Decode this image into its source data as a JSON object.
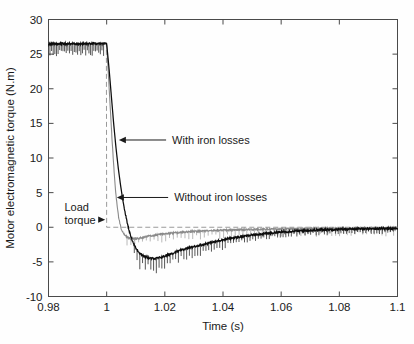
{
  "chart_data": {
    "type": "line",
    "title": "",
    "xlabel": "Time (s)",
    "ylabel": "Motor electromagnetic torque (N.m)",
    "xlim": [
      0.98,
      1.1
    ],
    "ylim": [
      -10,
      30
    ],
    "xticks": [
      0.98,
      1,
      1.02,
      1.04,
      1.06,
      1.08,
      1.1
    ],
    "xticklabels": [
      "0.98",
      "1",
      "1.02",
      "1.04",
      "1.06",
      "1.08",
      "1.1"
    ],
    "yticks": [
      -10,
      -5,
      0,
      5,
      10,
      15,
      20,
      25,
      30
    ],
    "yticklabels": [
      "-10",
      "-5",
      "0",
      "5",
      "10",
      "15",
      "20",
      "25",
      "30"
    ],
    "grid": false,
    "legend_position": "none",
    "box": true,
    "tick_direction": "in",
    "series": [
      {
        "name": "With iron losses",
        "color": "#0d0d0d",
        "style": "solid-noisy",
        "x": [
          0.98,
          0.9825,
          0.985,
          0.9875,
          0.99,
          0.9925,
          0.995,
          0.9975,
          1.0,
          1.0008,
          1.0016,
          1.0024,
          1.0032,
          1.004,
          1.0048,
          1.0056,
          1.0064,
          1.0072,
          1.008,
          1.009,
          1.01,
          1.0115,
          1.013,
          1.015,
          1.017,
          1.019,
          1.021,
          1.023,
          1.025,
          1.028,
          1.031,
          1.034,
          1.037,
          1.04,
          1.044,
          1.048,
          1.052,
          1.056,
          1.06,
          1.065,
          1.07,
          1.075,
          1.08,
          1.085,
          1.09,
          1.095,
          1.1
        ],
        "y": [
          26.5,
          26.5,
          26.5,
          26.5,
          26.5,
          26.5,
          26.5,
          26.5,
          26.5,
          23.0,
          19.0,
          15.0,
          11.5,
          8.5,
          6.0,
          3.8,
          2.0,
          0.4,
          -0.9,
          -2.1,
          -3.0,
          -3.8,
          -4.2,
          -4.5,
          -4.5,
          -4.3,
          -4.0,
          -3.7,
          -3.4,
          -3.0,
          -2.7,
          -2.4,
          -2.1,
          -1.8,
          -1.5,
          -1.25,
          -1.0,
          -0.85,
          -0.7,
          -0.55,
          -0.45,
          -0.35,
          -0.3,
          -0.25,
          -0.2,
          -0.18,
          -0.15
        ]
      },
      {
        "name": "Without iron losses",
        "color": "#8a8a8a",
        "style": "solid-noisy",
        "x": [
          0.98,
          0.985,
          0.99,
          0.995,
          1.0,
          1.0006,
          1.0012,
          1.0018,
          1.0024,
          1.003,
          1.0036,
          1.0042,
          1.005,
          1.006,
          1.007,
          1.008,
          1.0095,
          1.011,
          1.013,
          1.015,
          1.018,
          1.021,
          1.025,
          1.03,
          1.035,
          1.04,
          1.046,
          1.052,
          1.058,
          1.065,
          1.072,
          1.08,
          1.088,
          1.095,
          1.1
        ],
        "y": [
          26.5,
          26.5,
          26.5,
          26.5,
          26.5,
          22.0,
          17.5,
          13.0,
          9.0,
          5.6,
          3.0,
          1.2,
          -0.2,
          -1.0,
          -1.4,
          -1.6,
          -1.65,
          -1.6,
          -1.4,
          -1.25,
          -1.05,
          -0.9,
          -0.75,
          -0.6,
          -0.5,
          -0.42,
          -0.35,
          -0.3,
          -0.26,
          -0.22,
          -0.2,
          -0.18,
          -0.16,
          -0.15,
          -0.14
        ]
      },
      {
        "name": "Load torque",
        "color": "#9a9a9a",
        "style": "dashed-step",
        "x": [
          0.98,
          0.9999,
          1.0,
          1.1
        ],
        "y": [
          26.5,
          26.5,
          0.0,
          0.0
        ]
      }
    ],
    "annotations": [
      {
        "text": "With iron losses",
        "text_x": 1.0225,
        "text_y": 12.6,
        "arrow_tip_x": 1.0042,
        "arrow_tip_y": 12.6
      },
      {
        "text": "Without iron losses",
        "text_x": 1.0232,
        "text_y": 4.3,
        "arrow_tip_x": 1.0035,
        "arrow_tip_y": 4.3
      },
      {
        "text": "Load",
        "text2": "torque",
        "text_x": 0.9855,
        "text_y": 2.6,
        "arrow_tip_x": 0.9995,
        "arrow_tip_y": 1.1
      }
    ]
  },
  "colors": {
    "background": "#fefefe",
    "axis": "#4a4a4a",
    "with_iron_losses": "#0d0d0d",
    "without_iron_losses": "#8a8a8a",
    "load_torque": "#9a9a9a",
    "text": "#1a1a1a"
  }
}
